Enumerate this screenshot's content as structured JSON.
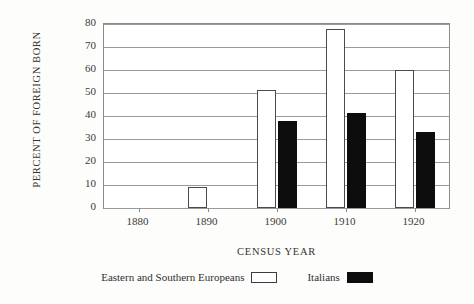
{
  "chart_data": {
    "type": "bar",
    "title": "",
    "subtitle": "",
    "xlabel": "CENSUS YEAR",
    "ylabel": "PERCENT OF FOREIGN BORN",
    "categories": [
      "1880",
      "1890",
      "1900",
      "1910",
      "1920"
    ],
    "series": [
      {
        "name": "Eastern and Southern Europeans",
        "color": "#ffffff",
        "edge_color": "#4a4a4a",
        "values": [
          0,
          9,
          51.5,
          78,
          60
        ]
      },
      {
        "name": "Italians",
        "color": "#0d0d0d",
        "edge_color": "#0d0d0d",
        "values": [
          0,
          0,
          38,
          41.5,
          33
        ]
      }
    ],
    "ylim": [
      0,
      80
    ],
    "yticks": [
      0,
      10,
      20,
      30,
      40,
      50,
      60,
      70,
      80
    ],
    "ytick_labels": [
      "0",
      "10",
      "20",
      "30",
      "40",
      "50",
      "60",
      "70",
      "80"
    ],
    "grid": true,
    "grid_axis": "y",
    "legend_position": "below-axis-centered",
    "annotations": []
  },
  "legend": {
    "entries": [
      {
        "label": "Eastern and Southern Europeans",
        "swatch": "light"
      },
      {
        "label": "Italians",
        "swatch": "dark"
      }
    ]
  }
}
